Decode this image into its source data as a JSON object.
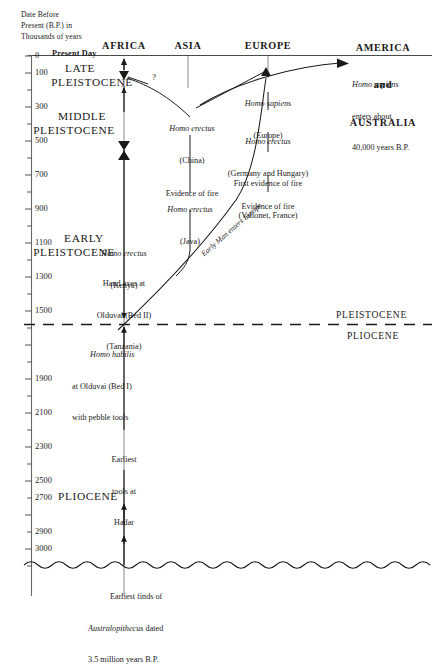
{
  "figure": {
    "axis_caption": "Date Before\nPresent (B.P.) in\nThousands of years",
    "present_day_label": "Present Day",
    "columns": [
      {
        "id": "africa",
        "label": "AFRICA"
      },
      {
        "id": "asia",
        "label": "ASIA"
      },
      {
        "id": "europe",
        "label": "EUROPE"
      },
      {
        "id": "america_australia",
        "label": "AMERICA\nand\nAUSTRALIA"
      }
    ],
    "america_australia_lines": [
      "AMERICA",
      "and",
      "AUSTRALIA"
    ],
    "axis_ticks": [
      {
        "value": "0",
        "major": true
      },
      {
        "value": "100",
        "major": true
      },
      {
        "value": "",
        "major": false
      },
      {
        "value": "300",
        "major": true
      },
      {
        "value": "",
        "major": false
      },
      {
        "value": "500",
        "major": true
      },
      {
        "value": "",
        "major": false
      },
      {
        "value": "700",
        "major": true
      },
      {
        "value": "",
        "major": false
      },
      {
        "value": "900",
        "major": true
      },
      {
        "value": "",
        "major": false
      },
      {
        "value": "1100",
        "major": true
      },
      {
        "value": "",
        "major": false
      },
      {
        "value": "1300",
        "major": true
      },
      {
        "value": "",
        "major": false
      },
      {
        "value": "1500",
        "major": true
      },
      {
        "value": "",
        "major": false
      },
      {
        "value": "",
        "major": false
      },
      {
        "value": "1900",
        "major": true
      },
      {
        "value": "",
        "major": false
      },
      {
        "value": "2100",
        "major": true
      },
      {
        "value": "",
        "major": false
      },
      {
        "value": "2300",
        "major": true
      },
      {
        "value": "",
        "major": false
      },
      {
        "value": "2500",
        "major": true
      },
      {
        "value": "",
        "major": false
      },
      {
        "value": "2700",
        "major": true
      },
      {
        "value": "",
        "major": false
      },
      {
        "value": "2900",
        "major": true
      },
      {
        "value": "3000",
        "major": true
      },
      {
        "value": "",
        "major": false
      }
    ],
    "epochs": [
      {
        "id": "late-pleistocene",
        "line1": "LATE",
        "line2": "PLEISTOCENE"
      },
      {
        "id": "middle-pleistocene",
        "line1": "MIDDLE",
        "line2": "PLEISTOCENE"
      },
      {
        "id": "early-pleistocene",
        "line1": "EARLY",
        "line2": "PLEISTOCENE"
      },
      {
        "id": "pliocene-left",
        "line1": "PLIOCENE",
        "line2": ""
      }
    ],
    "boundary": {
      "above_label": "PLEISTOCENE",
      "below_label": "PLIOCENE"
    },
    "events": [
      {
        "id": "hs-america",
        "line1": "Homo sapiens",
        "line2": "enters about",
        "line3": "40,000 years B.P.",
        "italic_first": true
      },
      {
        "id": "hs-europe",
        "line1": "Homo sapiens",
        "line2": "(Europe)",
        "italic_first": true
      },
      {
        "id": "he-china",
        "line1": "Homo erectus",
        "line2": "(China)",
        "line3": "Evidence of fire",
        "italic_first": true
      },
      {
        "id": "he-germany",
        "line1": "Homo erectus",
        "line2": "(Germany and Hungary)",
        "line3": "Evidence of fire",
        "italic_first": true
      },
      {
        "id": "first-fire",
        "line1": "First evidence of fire",
        "line2": "(Vallonet, France)",
        "italic_first": false
      },
      {
        "id": "he-java",
        "line1": "Homo erectus",
        "line2": "(Java)",
        "italic_first": true
      },
      {
        "id": "he-kenya",
        "line1": "Homo erectus",
        "line2": "(Kenya)",
        "italic_first": true
      },
      {
        "id": "hand-axes",
        "line1": "Hand axes at",
        "line2": "Olduvai (Bed II)",
        "line3": "(Tanzania)",
        "italic_first": false
      },
      {
        "id": "h-habilis",
        "line1": "Homo habilis",
        "line2": "at Olduvai (Bed I)",
        "line3": "with pebble tools",
        "italic_first": true
      },
      {
        "id": "earliest-tools",
        "line1": "Earliest",
        "line2": "tools at",
        "line3": "Hadar",
        "italic_first": false
      },
      {
        "id": "australopithecus",
        "line1": "Earliest finds of",
        "line2": "Australopithecus dated",
        "line3": "3.5 million years B.P.",
        "italic_first": false
      }
    ],
    "migration_label": "Early Man enters Europe",
    "question_marks": [
      "?",
      "?"
    ],
    "colors": {
      "ink": "#1a1a1a",
      "rule": "#555555"
    }
  }
}
